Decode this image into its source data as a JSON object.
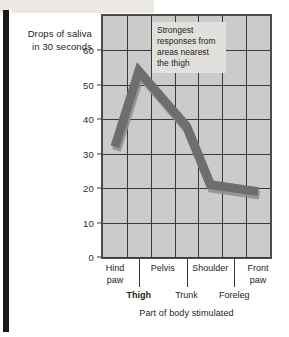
{
  "figure": {
    "y_axis_title": "Drops of saliva in 30 seconds",
    "x_axis_title": "Part of body stimulated",
    "annotation": "Strongest responses from areas nearest the thigh"
  },
  "colors": {
    "plot_background": "#cbcbcb",
    "plot_border": "#4c4c4c",
    "gridline": "#3a3a3a",
    "data_band": "#6e6e6e",
    "data_band_shadow": "#8d8d8d",
    "annotation_background": "#e2e0dc",
    "text": "#1d1d1d",
    "page_background": "#ffffff",
    "gutter": "#1a1a1a"
  },
  "chart_data": {
    "type": "line",
    "title": "",
    "subtitle": "",
    "xlabel": "Part of body stimulated",
    "ylabel": "Drops of saliva in 30 seconds",
    "ylim": [
      0,
      70
    ],
    "yticks": [
      0,
      10,
      20,
      30,
      40,
      50,
      60
    ],
    "xlim_categories": 7,
    "grid": true,
    "legend": "none",
    "annotations": [
      {
        "text": "Strongest responses from areas nearest the thigh",
        "x_category": "Pelvis",
        "y_value": 64
      }
    ],
    "categories": [
      "Hind paw",
      "Thigh",
      "Pelvis",
      "Trunk",
      "Shoulder",
      "Foreleg",
      "Front paw"
    ],
    "categories_upper_row": [
      "Hind paw",
      "Pelvis",
      "Shoulder",
      "Front paw"
    ],
    "categories_lower_row": [
      "Thigh",
      "Trunk",
      "Foreleg"
    ],
    "emphasized_category": "Thigh",
    "series": [
      {
        "name": "Drops of saliva in 30 seconds",
        "values": [
          32,
          54,
          46,
          38,
          21,
          20,
          19
        ]
      }
    ]
  },
  "y_ticks": [
    {
      "label": "60",
      "value": 60
    },
    {
      "label": "50",
      "value": 50
    },
    {
      "label": "40",
      "value": 40
    },
    {
      "label": "30",
      "value": 30
    },
    {
      "label": "20",
      "value": 20
    },
    {
      "label": "10",
      "value": 10
    },
    {
      "label": "0",
      "value": 0
    }
  ],
  "x_ticks_upper": [
    {
      "label": "Hind\npaw"
    },
    {
      "label": "Pelvis"
    },
    {
      "label": "Shoulder"
    },
    {
      "label": "Front\npaw"
    }
  ],
  "x_ticks_lower": [
    {
      "label": "Thigh"
    },
    {
      "label": "Trunk"
    },
    {
      "label": "Foreleg"
    }
  ]
}
